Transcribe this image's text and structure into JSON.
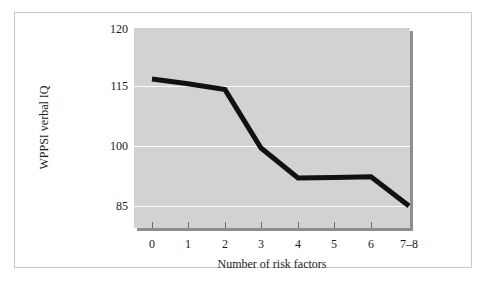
{
  "chart_data": {
    "type": "line",
    "title": "",
    "xlabel": "Number of risk factors",
    "ylabel": "WPPSI verbal IQ",
    "categories": [
      "0",
      "1",
      "2",
      "3",
      "4",
      "5",
      "6",
      "7–8"
    ],
    "x_tick_labels": [
      "0",
      "1",
      "2",
      "3",
      "4",
      "5",
      "6",
      "7–8"
    ],
    "y_tick_labels": [
      "120",
      "115",
      "100",
      "85"
    ],
    "y_tick_values": [
      120,
      115,
      100,
      85
    ],
    "ylim": [
      80,
      120
    ],
    "grid": "horizontal",
    "legend": "none",
    "series": [
      {
        "name": "WPPSI verbal IQ",
        "values": [
          115.6,
          115.2,
          114.1,
          99.5,
          92.0,
          92.1,
          92.3,
          85.0
        ],
        "color": "#111111"
      }
    ],
    "plot_background": "#d2d2d2",
    "gridline_color": "#fdfdfd"
  },
  "axes": {
    "y_title": "WPPSI verbal IQ",
    "x_title": "Number of risk factors",
    "y_ticks": [
      {
        "label": "120",
        "value": 120
      },
      {
        "label": "115",
        "value": 115
      },
      {
        "label": "100",
        "value": 100
      },
      {
        "label": "85",
        "value": 85
      }
    ],
    "x_ticks": [
      {
        "label": "0"
      },
      {
        "label": "1"
      },
      {
        "label": "2"
      },
      {
        "label": "3"
      },
      {
        "label": "4"
      },
      {
        "label": "5"
      },
      {
        "label": "6"
      },
      {
        "label": "7–8"
      }
    ]
  }
}
